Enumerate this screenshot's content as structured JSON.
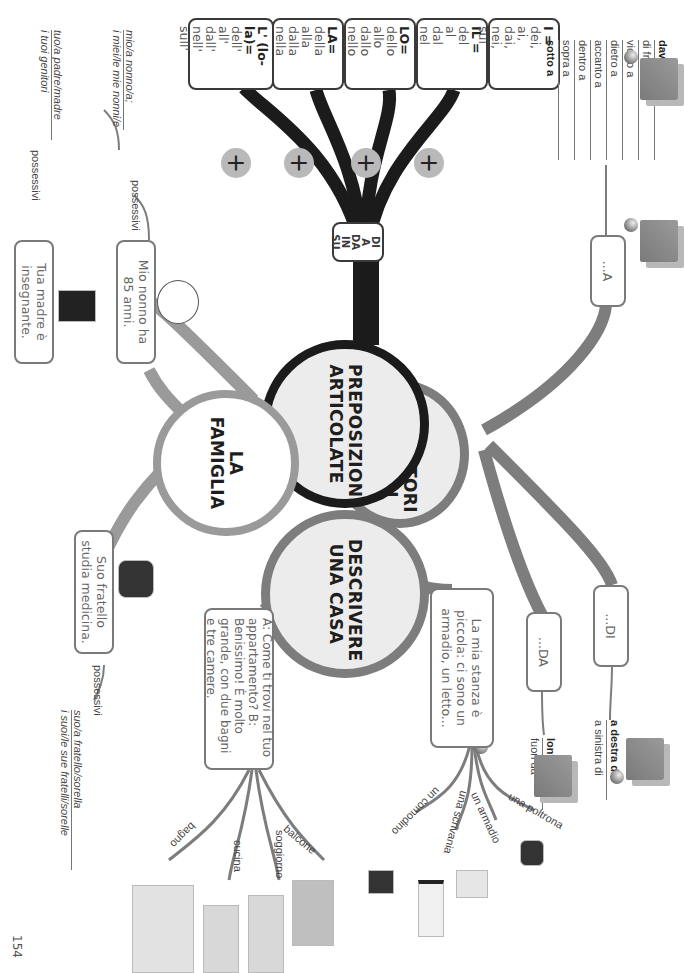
{
  "page": {
    "number": "154"
  },
  "centers": {
    "prepositions": "PREPOSIZIONI ARTICOLATE",
    "spatial": "INDICATORI SPAZIALI",
    "house": "DESCRIVERE UNA CASA",
    "family": "LA FAMIGLIA"
  },
  "prepositions_simple": [
    "DI",
    "A",
    "DA",
    "IN",
    "SU"
  ],
  "plus_symbol": "+",
  "articles": [
    {
      "header": "IL =",
      "forms": [
        "del",
        "al",
        "dal",
        "nel",
        "sul"
      ]
    },
    {
      "header": "I =",
      "forms": [
        "dei,",
        "ai,",
        "dai,",
        "nei,",
        "sui"
      ]
    },
    {
      "header": "LO=",
      "forms": [
        "dello",
        "allo",
        "dallo",
        "nello",
        "sullo"
      ]
    },
    {
      "header": "GLI=",
      "forms": [
        "degli",
        "agli",
        "dagli",
        "negli",
        "sugli"
      ]
    },
    {
      "header": "LA=",
      "forms": [
        "della",
        "alla",
        "dalla",
        "nella",
        "sulla"
      ]
    },
    {
      "header": "LE=",
      "forms": [
        "delle",
        "alle",
        "dalle",
        "nelle",
        "sulle"
      ]
    },
    {
      "header": "L' (lo-la)=",
      "forms": [
        "dell'",
        "all'",
        "dall'",
        "nell'",
        "sull'"
      ]
    }
  ],
  "spatial": {
    "a_box": "...A",
    "a_list": [
      {
        "text": "davanti a",
        "bold": true
      },
      {
        "text": "di fronte a",
        "bold": false
      },
      {
        "text": "vicino a",
        "bold": false
      },
      {
        "text": "dietro a",
        "bold": false
      },
      {
        "text": "accanto a",
        "bold": false
      },
      {
        "text": "dentro a",
        "bold": false
      },
      {
        "text": "sopra a",
        "bold": false
      },
      {
        "text": "sotto a",
        "bold": true
      }
    ],
    "di_box": "...DI",
    "di_list": [
      {
        "text": "a destra di",
        "bold": true
      },
      {
        "text": "a sinistra di",
        "bold": false
      }
    ],
    "da_box": "...DA",
    "da_list": [
      {
        "text": "lontano da",
        "bold": true
      },
      {
        "text": "fuori da",
        "bold": false
      }
    ]
  },
  "house": {
    "room_box": "La mia stanza è piccola: ci sono un armadio, un letto...",
    "room_items": [
      "una poltrona",
      "un armadio",
      "una scrivania",
      "un comodino"
    ],
    "dialog_box": "A: Come ti trovi nel tuo appartamento? B: Benissimo! È molto grande, con due bagni e tre camere.",
    "rooms": [
      "balcone",
      "soggiorno",
      "cucina",
      "bagno"
    ]
  },
  "family": {
    "grandpa_box": "Mio nonno ha 85 anni.",
    "grandpa_tag": "possessivi",
    "grandpa_forms": [
      "mio/a nonno/a;",
      "i miei/le mie nonni/e"
    ],
    "mother_box": "Tua madre è insegnante.",
    "mother_tag": "possessivi",
    "mother_forms": [
      "tuo/a padre/madre",
      "i tuoi genitori"
    ],
    "brother_box": "Suo fratello studia medicina.",
    "brother_tag": "possessivi",
    "brother_forms": [
      "suo/a fratello/sorella",
      "i suoi/le sue fratelli/sorelle"
    ]
  },
  "colors": {
    "dark_branch": "#1b1b1b",
    "mid_branch": "#7d7d7d",
    "light_branch": "#9a9a9a",
    "circle_fill": "#ececec"
  }
}
